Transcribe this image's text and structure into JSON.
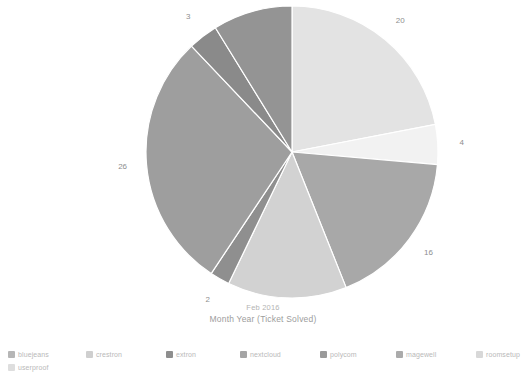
{
  "chart_data": {
    "type": "pie",
    "title": "Month Year (Ticket Solved)",
    "subtitle": "Feb 2016",
    "xlabel": "",
    "ylabel": "",
    "total": 91,
    "legend_position": "bottom",
    "grid": false,
    "categories": [
      "bluejeans",
      "crestron",
      "extron",
      "nextcloud",
      "polycom",
      "magewell",
      "roomsetup",
      "userproof"
    ],
    "values": [
      20,
      4,
      16,
      12,
      2,
      26,
      3,
      8
    ],
    "slices": [
      {
        "label": "20",
        "value": 20,
        "category": "bluejeans",
        "color": "#e3e3e3"
      },
      {
        "label": "4",
        "value": 4,
        "category": "crestron",
        "color": "#f2f2f2"
      },
      {
        "label": "16",
        "value": 16,
        "category": "extron",
        "color": "#a8a8a8"
      },
      {
        "label": "12",
        "value": 12,
        "category": "nextcloud",
        "color": "#d2d2d2"
      },
      {
        "label": "2",
        "value": 2,
        "category": "polycom",
        "color": "#8f8f8f"
      },
      {
        "label": "26",
        "value": 26,
        "category": "magewell",
        "color": "#9e9e9e"
      },
      {
        "label": "3",
        "value": 3,
        "category": "roomsetup",
        "color": "#8a8a8a"
      },
      {
        "label": "8",
        "value": 8,
        "category": "userproof",
        "color": "#949494"
      }
    ]
  },
  "legend": {
    "items": [
      {
        "label": "bluejeans",
        "color": "#b6b6b6"
      },
      {
        "label": "crestron",
        "color": "#cfcfcf"
      },
      {
        "label": "extron",
        "color": "#8e8e8e"
      },
      {
        "label": "nextcloud",
        "color": "#a5a5a5"
      },
      {
        "label": "polycom",
        "color": "#9a9a9a"
      },
      {
        "label": "magewell",
        "color": "#ababab"
      },
      {
        "label": "roomsetup",
        "color": "#d8d8d8"
      },
      {
        "label": "userproof",
        "color": "#dedede"
      }
    ]
  },
  "caption": {
    "subtitle": "Feb 2016",
    "title": "Month Year (Ticket Solved)"
  },
  "colors": {
    "background": "#ffffff",
    "label_text": "#8e8e8e",
    "caption_text": "#9d9d9d",
    "legend_text": "#b9b9b9"
  }
}
